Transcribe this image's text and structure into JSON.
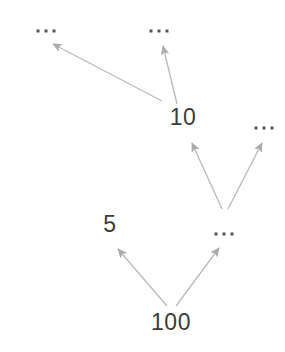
{
  "figure": {
    "title": "",
    "background_color": "#ffffff",
    "width": 285,
    "height": 352
  },
  "style": {
    "edge_color": "#bcbcbc",
    "arrowhead_color": "#ababab",
    "number_color": "#3b3b3b",
    "ellipsis_dot_color": "#555555"
  },
  "chart_data": {
    "type": "diagram",
    "diagram_type": "directed-graph",
    "title": "",
    "nodes": [
      {
        "id": "n1",
        "label": "...",
        "kind": "ellipsis",
        "x": 46,
        "y": 31
      },
      {
        "id": "n2",
        "label": "...",
        "kind": "ellipsis",
        "x": 159,
        "y": 31
      },
      {
        "id": "n3",
        "label": "10",
        "kind": "number",
        "x": 183,
        "y": 117
      },
      {
        "id": "n4",
        "label": "...",
        "kind": "ellipsis",
        "x": 264,
        "y": 128
      },
      {
        "id": "n5",
        "label": "5",
        "kind": "number",
        "x": 110,
        "y": 224
      },
      {
        "id": "n6",
        "label": "...",
        "kind": "ellipsis",
        "x": 224,
        "y": 234
      },
      {
        "id": "n7",
        "label": "100",
        "kind": "number",
        "x": 171,
        "y": 322
      }
    ],
    "edges": [
      {
        "from": "n3",
        "to": "n1",
        "x1": 162,
        "y1": 101,
        "x2": 53,
        "y2": 44
      },
      {
        "from": "n3",
        "to": "n2",
        "x1": 177,
        "y1": 104,
        "x2": 163,
        "y2": 46
      },
      {
        "from": "n6",
        "to": "n3",
        "x1": 222,
        "y1": 209,
        "x2": 192,
        "y2": 143
      },
      {
        "from": "n6",
        "to": "n4",
        "x1": 228,
        "y1": 209,
        "x2": 262,
        "y2": 143
      },
      {
        "from": "n7",
        "to": "n5",
        "x1": 167,
        "y1": 306,
        "x2": 118,
        "y2": 249
      },
      {
        "from": "n7",
        "to": "n6",
        "x1": 176,
        "y1": 306,
        "x2": 219,
        "y2": 248
      }
    ],
    "legend": [],
    "annotations": []
  }
}
